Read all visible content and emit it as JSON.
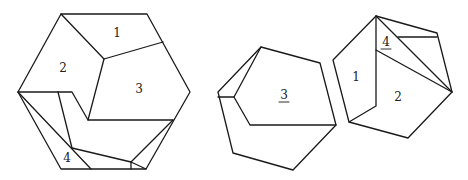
{
  "figures": [
    {
      "name": "assembled-hexagon",
      "labels": [
        {
          "text": "1",
          "x": 117,
          "y": 33,
          "underline": false
        },
        {
          "text": "2",
          "x": 63,
          "y": 68,
          "underline": false
        },
        {
          "text": "3",
          "x": 139,
          "y": 89,
          "underline": false
        },
        {
          "text": "4",
          "x": 67,
          "y": 158,
          "underline": false
        }
      ]
    },
    {
      "name": "piece-3-arrangement",
      "labels": [
        {
          "text": "3",
          "x": 284,
          "y": 95,
          "underline": true
        }
      ]
    },
    {
      "name": "pieces-1-2-4-arrangement",
      "labels": [
        {
          "text": "4",
          "x": 386,
          "y": 42,
          "underline": true
        },
        {
          "text": "1",
          "x": 356,
          "y": 77,
          "underline": false
        },
        {
          "text": "2",
          "x": 398,
          "y": 97,
          "underline": false
        }
      ]
    }
  ]
}
